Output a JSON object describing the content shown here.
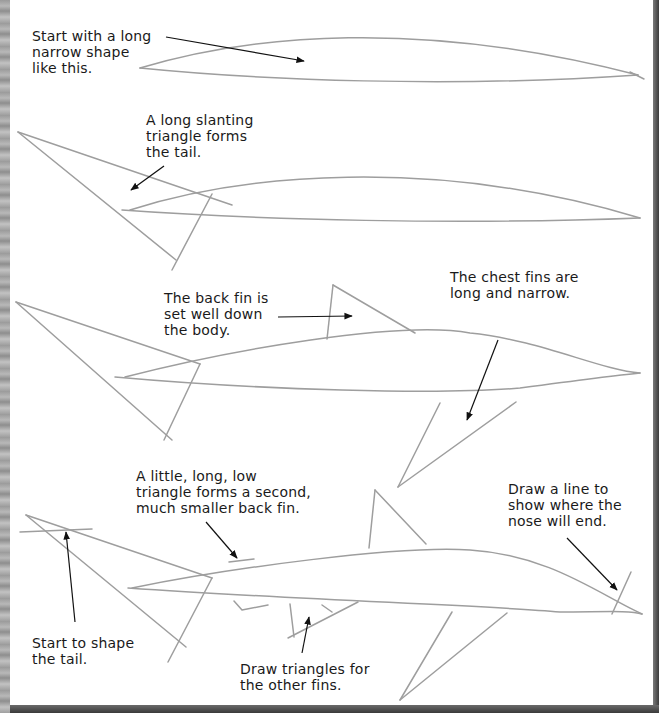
{
  "page": {
    "type": "drawing-tutorial",
    "steps": [
      {
        "id": "step-1",
        "captions": [
          {
            "id": "body-shape",
            "text": "Start with a long\nnarrow shape\nlike this."
          }
        ]
      },
      {
        "id": "step-2",
        "captions": [
          {
            "id": "tail-triangle",
            "text": "A long slanting\ntriangle forms\nthe tail."
          }
        ]
      },
      {
        "id": "step-3",
        "captions": [
          {
            "id": "back-fin",
            "text": "The back fin is\nset well down\nthe body."
          },
          {
            "id": "chest-fins",
            "text": "The chest fins are\nlong and narrow."
          }
        ]
      },
      {
        "id": "step-4",
        "captions": [
          {
            "id": "second-back-fin",
            "text": "A little, long, low\ntriangle forms a second,\nmuch smaller back fin."
          },
          {
            "id": "nose-line",
            "text": "Draw a line to\nshow where the\nnose will end."
          },
          {
            "id": "shape-tail",
            "text": "Start to shape\nthe tail."
          },
          {
            "id": "other-fins",
            "text": "Draw triangles for\nthe other fins."
          }
        ]
      }
    ]
  },
  "colors": {
    "pencil": "#9e9e9e",
    "ink": "#111111",
    "paper": "#ffffff",
    "border": "#3c3c3c"
  }
}
